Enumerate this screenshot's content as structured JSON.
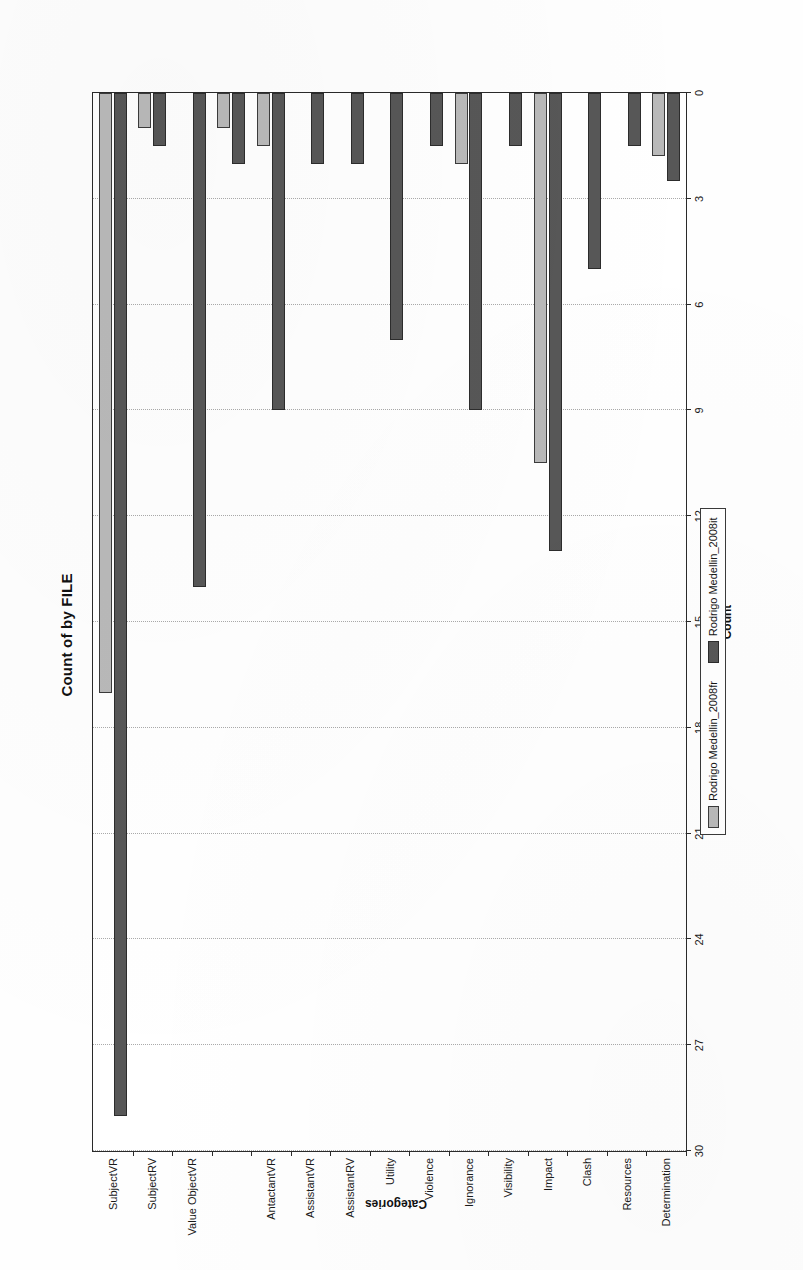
{
  "chart_data": {
    "type": "bar",
    "orientation": "horizontal",
    "title": "Count of by FILE",
    "xlabel": "Count",
    "ylabel": "Categories",
    "grid": true,
    "legend_position": "bottom",
    "value_axis": {
      "label": "Count",
      "min": 0,
      "max": 30,
      "step": 3,
      "ticks": [
        "0",
        "3",
        "6",
        "9",
        "12",
        "15",
        "18",
        "21",
        "24",
        "27",
        "30"
      ],
      "reversed": true
    },
    "category_axis": {
      "label": "Categories"
    },
    "categories": [
      "SubjectVR",
      "SubjectRV",
      "Value ObjectVR",
      "",
      "AntactantVR",
      "AssistantVR",
      "AssistantRV",
      "Utility",
      "Violence",
      "Ignorance",
      "Visibility",
      "Impact",
      "Clash",
      "Resources",
      "Determination"
    ],
    "series": [
      {
        "name": "Rodrigo Medellin_2008fr",
        "color": "#b9b9b9",
        "values": [
          17,
          1,
          0,
          1,
          1.5,
          0,
          0,
          0,
          0,
          2,
          0,
          10.5,
          0,
          0,
          1.8
        ]
      },
      {
        "name": "Rodrigo Medellin_2008it",
        "color": "#575757",
        "values": [
          29,
          1.5,
          14,
          2,
          9,
          2,
          2,
          7,
          1.5,
          9,
          1.5,
          13,
          5,
          1.5,
          2.5
        ]
      }
    ]
  },
  "legend": {
    "items": [
      {
        "label": "Rodrigo Medellin_2008fr",
        "swatch": "series-fr"
      },
      {
        "label": "Rodrigo Medellin_2008it",
        "swatch": "series-it"
      }
    ]
  }
}
